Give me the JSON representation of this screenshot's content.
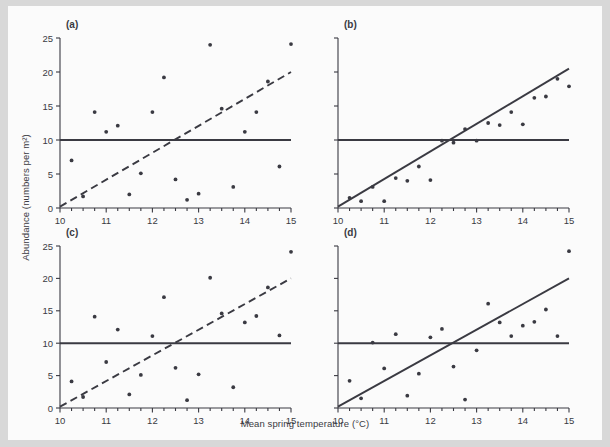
{
  "figure": {
    "background": "#fbfbfb",
    "page_background": "#d8d8d8",
    "ink_color": "#3a3a42",
    "xlabel": "Mean spring temperature (°C)",
    "ylabel": "Abundance (numbers per m²)",
    "panel_labels": [
      "(a)",
      "(b)",
      "(c)",
      "(d)"
    ]
  },
  "chart_data": [
    {
      "type": "scatter",
      "panel": "(a)",
      "title": "",
      "xlabel": "Mean spring temperature (°C)",
      "ylabel": "Abundance (numbers per m²)",
      "xlim": [
        10,
        15
      ],
      "ylim": [
        0,
        25
      ],
      "xticks": [
        10,
        11,
        12,
        13,
        14,
        15
      ],
      "xtick_labels": [
        "10",
        "11",
        "12",
        "13",
        "14",
        "15"
      ],
      "yticks": [
        0,
        5,
        10,
        15,
        20,
        25
      ],
      "ytick_labels": [
        "0",
        "5",
        "10",
        "15",
        "20",
        "25"
      ],
      "minor_xtick_step": 0.25,
      "grid": false,
      "legend": null,
      "points": [
        {
          "x": 10.25,
          "y": 7.0
        },
        {
          "x": 10.5,
          "y": 1.7
        },
        {
          "x": 10.75,
          "y": 14.1
        },
        {
          "x": 11.0,
          "y": 11.2
        },
        {
          "x": 11.25,
          "y": 12.1
        },
        {
          "x": 11.5,
          "y": 2.0
        },
        {
          "x": 11.75,
          "y": 5.1
        },
        {
          "x": 12.0,
          "y": 14.1
        },
        {
          "x": 12.25,
          "y": 19.2
        },
        {
          "x": 12.5,
          "y": 4.2
        },
        {
          "x": 12.75,
          "y": 1.2
        },
        {
          "x": 13.0,
          "y": 2.1
        },
        {
          "x": 13.25,
          "y": 24.0
        },
        {
          "x": 13.5,
          "y": 14.6
        },
        {
          "x": 13.75,
          "y": 3.1
        },
        {
          "x": 14.0,
          "y": 11.2
        },
        {
          "x": 14.25,
          "y": 14.1
        },
        {
          "x": 14.5,
          "y": 18.6
        },
        {
          "x": 14.75,
          "y": 6.1
        },
        {
          "x": 15.0,
          "y": 24.1
        }
      ],
      "lines": [
        {
          "name": "trend-line",
          "style": "dashed",
          "x0": 10,
          "y0": 0.2,
          "x1": 15,
          "y1": 20.0
        },
        {
          "name": "reference-line",
          "style": "solid",
          "x0": 10,
          "y0": 10,
          "x1": 15,
          "y1": 10
        }
      ]
    },
    {
      "type": "scatter",
      "panel": "(b)",
      "title": "",
      "xlabel": "Mean spring temperature (°C)",
      "ylabel": "Abundance (numbers per m²)",
      "xlim": [
        10,
        15
      ],
      "ylim": [
        0,
        25
      ],
      "xticks": [
        10,
        11,
        12,
        13,
        14,
        15
      ],
      "xtick_labels": [
        "10",
        "11",
        "12",
        "13",
        "14",
        "15"
      ],
      "yticks": [
        0,
        5,
        10,
        15,
        20,
        25
      ],
      "ytick_labels": [
        "",
        "",
        "",
        "",
        "",
        ""
      ],
      "minor_xtick_step": 0.25,
      "grid": false,
      "legend": null,
      "points": [
        {
          "x": 10.25,
          "y": 1.5
        },
        {
          "x": 10.5,
          "y": 1.0
        },
        {
          "x": 10.75,
          "y": 3.1
        },
        {
          "x": 11.0,
          "y": 1.0
        },
        {
          "x": 11.25,
          "y": 4.4
        },
        {
          "x": 11.5,
          "y": 4.0
        },
        {
          "x": 11.75,
          "y": 6.1
        },
        {
          "x": 12.0,
          "y": 4.1
        },
        {
          "x": 12.25,
          "y": 9.9
        },
        {
          "x": 12.5,
          "y": 9.6
        },
        {
          "x": 12.75,
          "y": 11.6
        },
        {
          "x": 13.0,
          "y": 9.9
        },
        {
          "x": 13.25,
          "y": 12.5
        },
        {
          "x": 13.5,
          "y": 12.2
        },
        {
          "x": 13.75,
          "y": 14.1
        },
        {
          "x": 14.0,
          "y": 12.3
        },
        {
          "x": 14.25,
          "y": 16.2
        },
        {
          "x": 14.5,
          "y": 16.4
        },
        {
          "x": 14.75,
          "y": 19.0
        },
        {
          "x": 15.0,
          "y": 17.9
        }
      ],
      "lines": [
        {
          "name": "regression-line",
          "style": "solid",
          "x0": 10,
          "y0": 0.2,
          "x1": 15,
          "y1": 20.5
        },
        {
          "name": "reference-line",
          "style": "solid",
          "x0": 10,
          "y0": 10,
          "x1": 15,
          "y1": 10
        }
      ]
    },
    {
      "type": "scatter",
      "panel": "(c)",
      "title": "",
      "xlabel": "Mean spring temperature (°C)",
      "ylabel": "Abundance (numbers per m²)",
      "xlim": [
        10,
        15
      ],
      "ylim": [
        0,
        25
      ],
      "xticks": [
        10,
        11,
        12,
        13,
        14,
        15
      ],
      "xtick_labels": [
        "10",
        "11",
        "12",
        "13",
        "14",
        "15"
      ],
      "yticks": [
        0,
        5,
        10,
        15,
        20,
        25
      ],
      "ytick_labels": [
        "0",
        "5",
        "10",
        "15",
        "20",
        "25"
      ],
      "minor_xtick_step": 0.25,
      "grid": false,
      "legend": null,
      "points": [
        {
          "x": 10.25,
          "y": 4.1
        },
        {
          "x": 10.5,
          "y": 1.7
        },
        {
          "x": 10.75,
          "y": 14.1
        },
        {
          "x": 11.0,
          "y": 7.1
        },
        {
          "x": 11.25,
          "y": 12.1
        },
        {
          "x": 11.5,
          "y": 2.1
        },
        {
          "x": 11.75,
          "y": 5.1
        },
        {
          "x": 12.0,
          "y": 11.1
        },
        {
          "x": 12.25,
          "y": 17.1
        },
        {
          "x": 12.5,
          "y": 6.2
        },
        {
          "x": 12.75,
          "y": 1.2
        },
        {
          "x": 13.0,
          "y": 5.2
        },
        {
          "x": 13.25,
          "y": 20.1
        },
        {
          "x": 13.5,
          "y": 14.6
        },
        {
          "x": 13.75,
          "y": 3.2
        },
        {
          "x": 14.0,
          "y": 13.2
        },
        {
          "x": 14.25,
          "y": 14.2
        },
        {
          "x": 14.5,
          "y": 18.6
        },
        {
          "x": 14.75,
          "y": 11.2
        },
        {
          "x": 15.0,
          "y": 24.1
        }
      ],
      "lines": [
        {
          "name": "trend-line",
          "style": "dashed",
          "x0": 10,
          "y0": 0.2,
          "x1": 15,
          "y1": 20.0
        },
        {
          "name": "reference-line",
          "style": "solid",
          "x0": 10,
          "y0": 10,
          "x1": 15,
          "y1": 10
        }
      ]
    },
    {
      "type": "scatter",
      "panel": "(d)",
      "title": "",
      "xlabel": "Mean spring temperature (°C)",
      "ylabel": "Abundance (numbers per m²)",
      "xlim": [
        10,
        15
      ],
      "ylim": [
        0,
        25
      ],
      "xticks": [
        10,
        11,
        12,
        13,
        14,
        15
      ],
      "xtick_labels": [
        "10",
        "11",
        "12",
        "13",
        "14",
        "15"
      ],
      "yticks": [
        0,
        5,
        10,
        15,
        20,
        25
      ],
      "ytick_labels": [
        "",
        "",
        "",
        "",
        "",
        ""
      ],
      "minor_xtick_step": 0.25,
      "grid": false,
      "legend": null,
      "points": [
        {
          "x": 10.25,
          "y": 4.2
        },
        {
          "x": 10.5,
          "y": 1.5
        },
        {
          "x": 10.75,
          "y": 10.1
        },
        {
          "x": 11.0,
          "y": 6.1
        },
        {
          "x": 11.25,
          "y": 11.4
        },
        {
          "x": 11.5,
          "y": 1.9
        },
        {
          "x": 11.75,
          "y": 5.3
        },
        {
          "x": 12.0,
          "y": 10.9
        },
        {
          "x": 12.25,
          "y": 12.2
        },
        {
          "x": 12.5,
          "y": 6.4
        },
        {
          "x": 12.75,
          "y": 1.3
        },
        {
          "x": 13.0,
          "y": 8.9
        },
        {
          "x": 13.25,
          "y": 16.1
        },
        {
          "x": 13.5,
          "y": 13.2
        },
        {
          "x": 13.75,
          "y": 11.1
        },
        {
          "x": 14.0,
          "y": 12.7
        },
        {
          "x": 14.25,
          "y": 13.3
        },
        {
          "x": 14.5,
          "y": 15.2
        },
        {
          "x": 14.75,
          "y": 11.1
        },
        {
          "x": 15.0,
          "y": 24.2
        }
      ],
      "lines": [
        {
          "name": "regression-line",
          "style": "solid",
          "x0": 10,
          "y0": 0.2,
          "x1": 15,
          "y1": 20.0
        },
        {
          "name": "reference-line",
          "style": "solid",
          "x0": 10,
          "y0": 10,
          "x1": 15,
          "y1": 10
        }
      ]
    }
  ]
}
